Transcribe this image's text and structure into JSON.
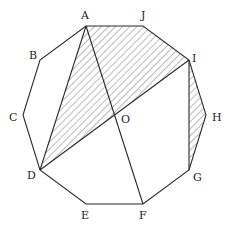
{
  "diagram": {
    "type": "regular-decagon",
    "center": {
      "name": "O",
      "x": 115,
      "y": 115
    },
    "vertices": [
      {
        "name": "A",
        "x": 86,
        "y": 26,
        "label_x": 81,
        "label_y": 19
      },
      {
        "name": "J",
        "x": 143,
        "y": 26,
        "label_x": 141,
        "label_y": 19
      },
      {
        "name": "I",
        "x": 189,
        "y": 60,
        "label_x": 192,
        "label_y": 62
      },
      {
        "name": "H",
        "x": 206,
        "y": 115,
        "label_x": 212,
        "label_y": 121
      },
      {
        "name": "G",
        "x": 189,
        "y": 170,
        "label_x": 193,
        "label_y": 181
      },
      {
        "name": "F",
        "x": 143,
        "y": 204,
        "label_x": 139,
        "label_y": 219
      },
      {
        "name": "E",
        "x": 86,
        "y": 204,
        "label_x": 81,
        "label_y": 219
      },
      {
        "name": "D",
        "x": 40,
        "y": 170,
        "label_x": 27,
        "label_y": 179
      },
      {
        "name": "C",
        "x": 23,
        "y": 115,
        "label_x": 9,
        "label_y": 121
      },
      {
        "name": "B",
        "x": 40,
        "y": 60,
        "label_x": 29,
        "label_y": 59
      }
    ],
    "segments": [
      {
        "from": "A",
        "to": "D"
      },
      {
        "from": "A",
        "to": "F"
      },
      {
        "from": "D",
        "to": "I"
      },
      {
        "from": "I",
        "to": "G"
      }
    ],
    "shaded_regions": [
      {
        "name": "quadrilateral AJID",
        "points": [
          "A",
          "J",
          "I",
          "D"
        ]
      },
      {
        "name": "triangle IHG",
        "points": [
          "I",
          "H",
          "G"
        ]
      }
    ],
    "hatch": {
      "direction": "top-left to bottom-right",
      "spacing": 5,
      "color": "#555555"
    },
    "labels": {
      "A": "A",
      "B": "B",
      "C": "C",
      "D": "D",
      "E": "E",
      "F": "F",
      "G": "G",
      "H": "H",
      "I": "I",
      "J": "J",
      "O": "O"
    },
    "center_label": {
      "text": "O",
      "x": 121,
      "y": 123
    }
  }
}
